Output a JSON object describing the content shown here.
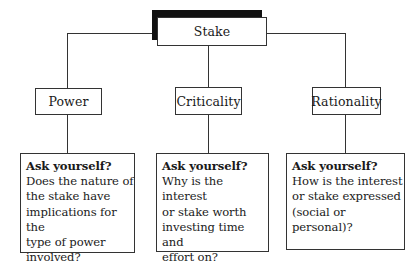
{
  "root": {
    "label": "Stake"
  },
  "dimensions": [
    {
      "id": "power",
      "label": "Power",
      "question_heading": "Ask yourself?",
      "question_text": "Does the nature of\nthe stake have\nimplications for the\ntype of power\ninvolved?"
    },
    {
      "id": "criticality",
      "label": "Criticality",
      "question_heading": "Ask yourself?",
      "question_text": "Why is the interest\nor stake worth\ninvesting time and\neffort on?"
    },
    {
      "id": "rationality",
      "label": "Rationality",
      "question_heading": "Ask yourself?",
      "question_text": "How is the interest\nor stake expressed\n(social or personal)?"
    }
  ],
  "colors": {
    "line": "#333333",
    "shadow": "#111111",
    "background": "#ffffff"
  }
}
